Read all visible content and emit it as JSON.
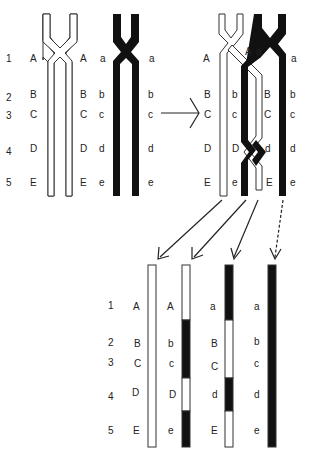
{
  "diagram": {
    "colors": {
      "white_strand": "#ffffff",
      "black_strand": "#111111",
      "outline": "#222222"
    },
    "row_numbers": [
      "1",
      "2",
      "3",
      "4",
      "5"
    ],
    "panel1": {
      "white_left_labels": [
        "A",
        "B",
        "C",
        "D",
        "E"
      ],
      "white_right_labels": [
        "A",
        "B",
        "C",
        "D",
        "E"
      ],
      "black_left_labels": [
        "a",
        "b",
        "c",
        "d",
        "e"
      ],
      "black_right_labels": [
        "a",
        "b",
        "c",
        "d",
        "e"
      ]
    },
    "panel2": {
      "labels_col1": [
        "A",
        "B",
        "C",
        "D",
        "E"
      ],
      "labels_col2": [
        "b",
        "c",
        "D",
        "e"
      ],
      "labels_col3": [
        "A",
        "B",
        "C",
        "d",
        "E"
      ],
      "label_a_top": "a",
      "labels_col4": [
        "a",
        "b",
        "c",
        "d",
        "e"
      ]
    },
    "products": [
      {
        "labels": [
          "A",
          "B",
          "C",
          "D",
          "E"
        ],
        "pattern": "white"
      },
      {
        "labels": [
          "A",
          "b",
          "c",
          "D",
          "e"
        ],
        "pattern": "recombinant-1"
      },
      {
        "labels": [
          "a",
          "B",
          "C",
          "d",
          "E"
        ],
        "pattern": "recombinant-2"
      },
      {
        "labels": [
          "a",
          "b",
          "c",
          "d",
          "e"
        ],
        "pattern": "black"
      }
    ],
    "arrow": "right-arrow"
  }
}
